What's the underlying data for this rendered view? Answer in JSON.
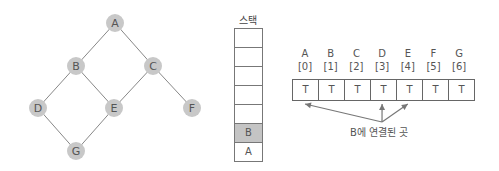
{
  "graph": {
    "nodes": [
      {
        "id": "A",
        "x": 115,
        "y": 23
      },
      {
        "id": "B",
        "x": 76,
        "y": 66
      },
      {
        "id": "C",
        "x": 153,
        "y": 66
      },
      {
        "id": "D",
        "x": 38,
        "y": 108
      },
      {
        "id": "E",
        "x": 114,
        "y": 108
      },
      {
        "id": "F",
        "x": 192,
        "y": 108
      },
      {
        "id": "G",
        "x": 76,
        "y": 151
      }
    ],
    "edges": [
      [
        "A",
        "B"
      ],
      [
        "A",
        "C"
      ],
      [
        "B",
        "D"
      ],
      [
        "B",
        "E"
      ],
      [
        "C",
        "E"
      ],
      [
        "C",
        "F"
      ],
      [
        "D",
        "G"
      ],
      [
        "E",
        "G"
      ]
    ],
    "node_color": "#c8c8c8",
    "edge_color": "#888888"
  },
  "stack": {
    "title": "스택",
    "cells": [
      "",
      "",
      "",
      "",
      "",
      "B",
      "A"
    ],
    "highlight_index": 5
  },
  "array": {
    "labels": [
      "A",
      "B",
      "C",
      "D",
      "E",
      "F",
      "G"
    ],
    "indices": [
      "[0]",
      "[1]",
      "[2]",
      "[3]",
      "[4]",
      "[5]",
      "[6]"
    ],
    "values": [
      "T",
      "T",
      "T",
      "T",
      "T",
      "T",
      "T"
    ]
  },
  "annotation": {
    "caption": "B에 연결된 곳",
    "targets": [
      0,
      3,
      4
    ]
  }
}
